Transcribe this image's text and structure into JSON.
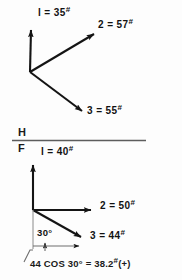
{
  "figure": {
    "background_color": "#fdfdfd",
    "ink_color": "#141414"
  },
  "top_diagram": {
    "name": "horizontal-view-vector-triad",
    "origin": {
      "x": 30,
      "y": 72
    },
    "vectors": [
      {
        "id": "1",
        "label": "l = 35",
        "unit_mark": "#",
        "magnitude": 35,
        "direction": "up",
        "tip": {
          "x": 31,
          "y": 28
        },
        "label_pos": {
          "x": 40,
          "y": 10
        }
      },
      {
        "id": "2",
        "label": "2 = 57",
        "unit_mark": "#",
        "magnitude": 57,
        "direction": "up-right",
        "tip": {
          "x": 96,
          "y": 32
        },
        "label_pos": {
          "x": 98,
          "y": 20
        }
      },
      {
        "id": "3",
        "label": "3 = 55",
        "unit_mark": "#",
        "magnitude": 55,
        "direction": "down-right",
        "tip": {
          "x": 85,
          "y": 114
        },
        "label_pos": {
          "x": 88,
          "y": 108
        }
      }
    ]
  },
  "divider": {
    "name": "h-f-reference-line",
    "upper_label": "H",
    "lower_label": "F",
    "line": {
      "x1": 12,
      "y1": 140,
      "x2": 146,
      "y2": 140
    }
  },
  "bottom_diagram": {
    "name": "frontal-view-vector-triad",
    "origin": {
      "x": 33,
      "y": 210
    },
    "vectors": [
      {
        "id": "1",
        "label": "l = 40",
        "unit_mark": "#",
        "magnitude": 40,
        "direction": "up",
        "tip": {
          "x": 33,
          "y": 163
        },
        "label_pos": {
          "x": 42,
          "y": 148
        }
      },
      {
        "id": "2",
        "label": "2 = 50",
        "unit_mark": "#",
        "magnitude": 50,
        "direction": "right",
        "tip": {
          "x": 93,
          "y": 210
        },
        "label_pos": {
          "x": 100,
          "y": 202
        }
      },
      {
        "id": "3",
        "label": "3 = 44",
        "unit_mark": "#",
        "magnitude": 44,
        "direction": "down-right",
        "tip": {
          "x": 83,
          "y": 239
        },
        "label_pos": {
          "x": 90,
          "y": 232
        }
      }
    ],
    "angle": {
      "name": "angle-30-degrees",
      "value": "30°",
      "between": [
        "vertical-drop-line",
        "vector-3"
      ]
    },
    "projection": {
      "name": "horizontal-projection-dimension",
      "from_x": 33,
      "to_x": 83,
      "y": 246
    }
  },
  "caption": {
    "name": "projection-calculation",
    "text": "44 COS 30° = 38.2",
    "unit_mark": "#",
    "sign": "(+)",
    "value": 38.2
  }
}
